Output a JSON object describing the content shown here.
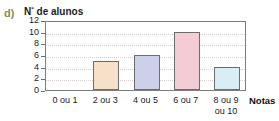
{
  "item_letter": "d)",
  "chart_data": {
    "type": "bar",
    "title": "Nº de alunos",
    "title_main": "N",
    "title_sup": "º",
    "title_rest": " de alunos",
    "xlabel": "Notas",
    "ylabel": "Nº de alunos",
    "categories": [
      "0 ou 1",
      "2 ou 3",
      "4 ou 5",
      "6 ou 7",
      "8 ou 9\nou 10"
    ],
    "values": [
      0,
      5,
      6,
      10,
      4
    ],
    "ylim": [
      0,
      12
    ],
    "yticks": [
      0,
      2,
      4,
      6,
      8,
      10,
      12
    ],
    "ytick_labels": [
      "0",
      "2",
      "4",
      "6",
      "8",
      "10",
      "12"
    ],
    "grid": true,
    "legend": "none",
    "bar_colors": [
      "#ffffff",
      "#f7e0c8",
      "#ccd0e8",
      "#f3ccd6",
      "#d8eef4"
    ],
    "bar_border_color": "#6d6d6d",
    "frame_color": "#7d7d7d",
    "gridline_color": "#d7cfd2",
    "letter_color": "#8a8c55",
    "text_color": "#1c1c1c",
    "background": "#ffffff"
  }
}
